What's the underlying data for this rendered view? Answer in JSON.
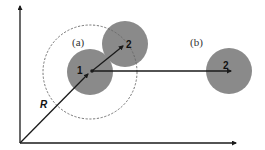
{
  "diagram": {
    "axes": {
      "origin": [
        20,
        143
      ],
      "x_axis_end": [
        237,
        143
      ],
      "y_axis_end": [
        20,
        5
      ]
    },
    "colors": {
      "particle_fill": "#8a8a8a",
      "line": "#1a1a1a",
      "dashed_circle": "#666666",
      "background": "#ffffff"
    },
    "cutoff_circle": {
      "center": [
        90,
        72
      ],
      "radius": 47,
      "style": "dashed"
    },
    "particles": [
      {
        "id": "p1",
        "label": "1",
        "center": [
          90,
          72
        ],
        "radius": 23,
        "label_pos": [
          78,
          74
        ]
      },
      {
        "id": "p2a",
        "label": "2",
        "center": [
          125,
          44
        ],
        "radius": 23,
        "label_pos": [
          127,
          48
        ]
      },
      {
        "id": "p2b",
        "label": "2",
        "center": [
          229,
          71
        ],
        "radius": 23,
        "label_pos": [
          224,
          69
        ]
      }
    ],
    "vectors": [
      {
        "id": "R",
        "from": [
          20,
          143
        ],
        "to": [
          89,
          73
        ]
      },
      {
        "id": "r12a",
        "from": [
          92,
          71
        ],
        "to": [
          124,
          45
        ]
      },
      {
        "id": "r12b",
        "from": [
          92,
          71
        ],
        "to": [
          232,
          71
        ]
      }
    ],
    "labels": {
      "case_a": "(a)",
      "case_b": "(b)",
      "position_vector": "R",
      "particle_1": "1",
      "particle_2a": "2",
      "particle_2b": "2"
    }
  }
}
